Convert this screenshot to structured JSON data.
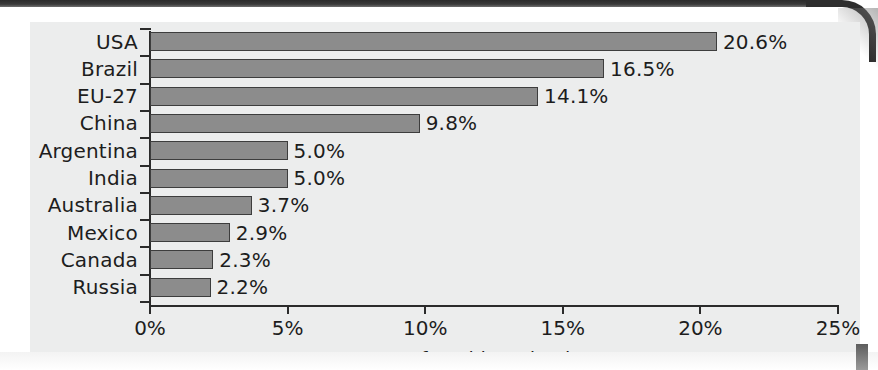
{
  "chart_data": {
    "type": "bar",
    "orientation": "horizontal",
    "title": "",
    "xlabel": "Percentage of world production",
    "ylabel": "",
    "xlim": [
      0,
      25
    ],
    "xticks": [
      "0%",
      "5%",
      "10%",
      "15%",
      "20%",
      "25%"
    ],
    "xtick_values": [
      0,
      5,
      10,
      15,
      20,
      25
    ],
    "grid": false,
    "legend": null,
    "unit": "%",
    "categories": [
      "USA",
      "Brazil",
      "EU-27",
      "China",
      "Argentina",
      "India",
      "Australia",
      "Mexico",
      "Canada",
      "Russia"
    ],
    "values": [
      20.6,
      16.5,
      14.1,
      9.8,
      5.0,
      5.0,
      3.7,
      2.9,
      2.3,
      2.2
    ],
    "data_labels": [
      "20.6%",
      "16.5%",
      "14.1%",
      "9.8%",
      "5.0%",
      "5.0%",
      "3.7%",
      "2.9%",
      "2.3%",
      "2.2%"
    ],
    "bars": [
      {
        "category": "USA",
        "value": 20.6,
        "label": "20.6%"
      },
      {
        "category": "Brazil",
        "value": 16.5,
        "label": "16.5%"
      },
      {
        "category": "EU-27",
        "value": 14.1,
        "label": "14.1%"
      },
      {
        "category": "China",
        "value": 9.8,
        "label": "9.8%"
      },
      {
        "category": "Argentina",
        "value": 5.0,
        "label": "5.0%"
      },
      {
        "category": "India",
        "value": 5.0,
        "label": "5.0%"
      },
      {
        "category": "Australia",
        "value": 3.7,
        "label": "3.7%"
      },
      {
        "category": "Mexico",
        "value": 2.9,
        "label": "2.9%"
      },
      {
        "category": "Canada",
        "value": 2.3,
        "label": "2.3%"
      },
      {
        "category": "Russia",
        "value": 2.2,
        "label": "2.2%"
      }
    ],
    "colors": {
      "bar_fill": "#8c8c8c",
      "bar_border": "#3d3d3d",
      "axis": "#2b2b2b",
      "text": "#1d1d1d",
      "panel_background": "#eceded",
      "page_background": "#ffffff"
    }
  }
}
